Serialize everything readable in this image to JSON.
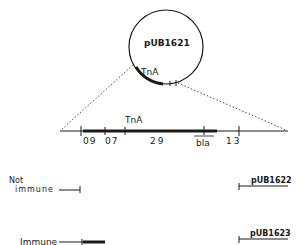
{
  "plasmid": {
    "name": "pUB1621",
    "transposon_label": "TnA"
  },
  "map": {
    "transposon_label": "TnA",
    "segments": [
      "09",
      "07",
      "29",
      "bla",
      "13"
    ]
  },
  "derivatives": [
    {
      "phenotype_line1": "Not",
      "phenotype_line2": "immune",
      "plasmid": "pUB1622"
    },
    {
      "phenotype": "Immune",
      "plasmid": "pUB1623"
    }
  ],
  "colors": {
    "line": "#1a1a1a",
    "background": "#ffffff"
  }
}
